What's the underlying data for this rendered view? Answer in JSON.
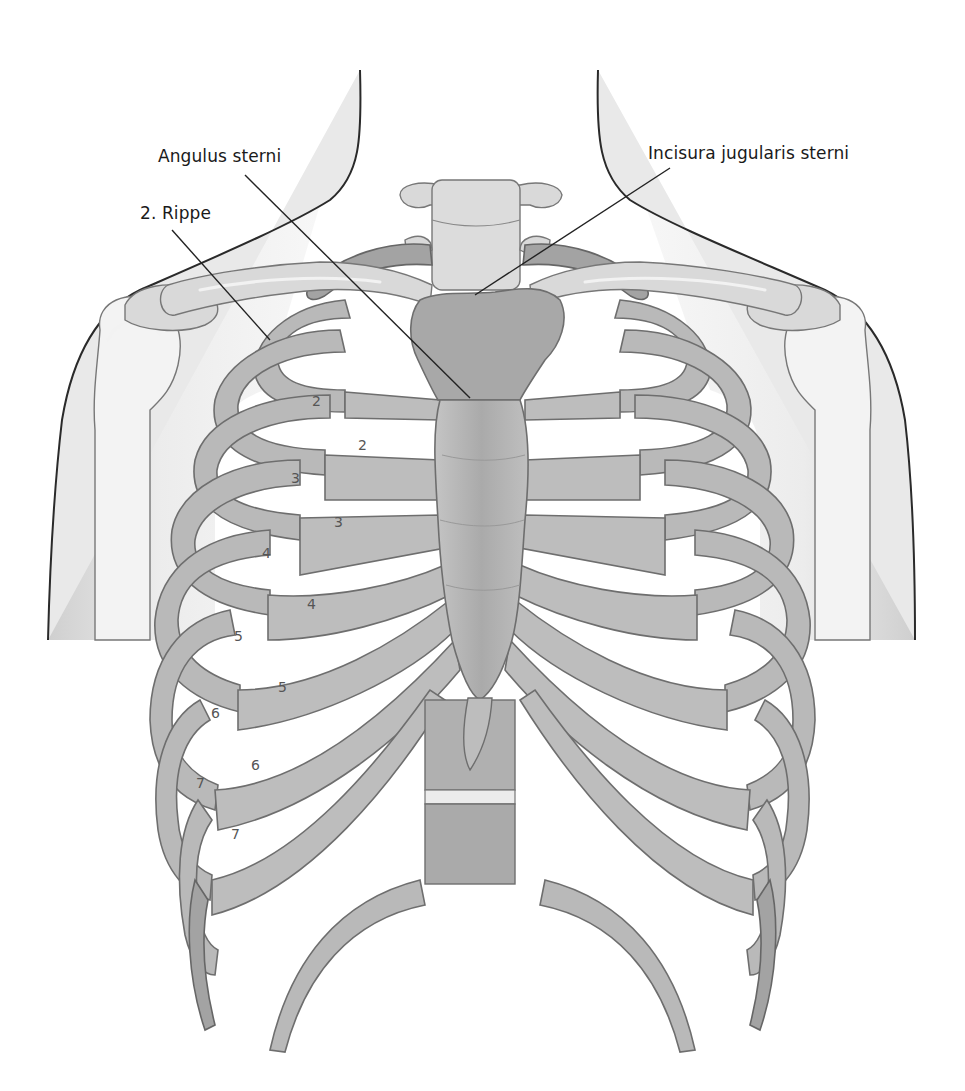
{
  "figure": {
    "type": "anatomical-illustration",
    "colors": {
      "background": "#ffffff",
      "bone": "#b9b9b9",
      "bone_outline": "#6e6e6e",
      "skin_outline": "#2a2a2a",
      "label_text": "#1a1a1a",
      "number_text": "#555555"
    }
  },
  "labels": {
    "angulus_sterni": "Angulus sterni",
    "incisura_jugularis": "Incisura jugularis sterni",
    "rippe_2": "2. Rippe"
  },
  "rib_numbers": [
    {
      "id": "rib-2",
      "text": "2"
    },
    {
      "id": "rib-3",
      "text": "3"
    },
    {
      "id": "rib-4",
      "text": "4"
    },
    {
      "id": "rib-5",
      "text": "5"
    },
    {
      "id": "rib-6",
      "text": "6"
    },
    {
      "id": "rib-7",
      "text": "7"
    }
  ],
  "intercostal_numbers": [
    {
      "id": "ics-2",
      "text": "2"
    },
    {
      "id": "ics-3",
      "text": "3"
    },
    {
      "id": "ics-4",
      "text": "4"
    },
    {
      "id": "ics-5",
      "text": "5"
    },
    {
      "id": "ics-6",
      "text": "6"
    },
    {
      "id": "ics-7",
      "text": "7"
    }
  ]
}
